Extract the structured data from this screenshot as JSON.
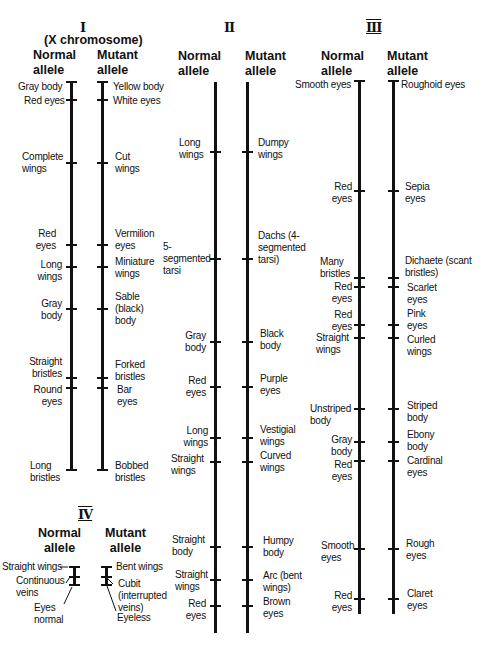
{
  "figure": {
    "type": "genetic-map-of-drosophila-chromosomes",
    "column_headers": {
      "normal": "Normal\nallele",
      "mutant": "Mutant\nallele"
    }
  },
  "chromosomes": [
    {
      "id": "I",
      "numeral": "I",
      "subtitle": "(X chromosome)",
      "normal_header": "Normal",
      "normal_header2": "allele",
      "mutant_header": "Mutant",
      "mutant_header2": "allele",
      "loci": [
        {
          "normal": "Gray body",
          "mutant": "Yellow body"
        },
        {
          "normal": "Red eyes",
          "mutant": "White eyes"
        },
        {
          "normal": "Complete wings",
          "mutant": "Cut wings"
        },
        {
          "normal": "Red eyes",
          "mutant": "Vermilion eyes"
        },
        {
          "normal": "Long wings",
          "mutant": "Miniature wings"
        },
        {
          "normal": "Gray body",
          "mutant": "Sable (black) body"
        },
        {
          "normal": "Straight bristles",
          "mutant": "Forked bristles"
        },
        {
          "normal": "Round eyes",
          "mutant": "Bar eyes"
        },
        {
          "normal": "Long bristles",
          "mutant": "Bobbed bristles"
        }
      ]
    },
    {
      "id": "II",
      "numeral": "II",
      "normal_header": "Normal",
      "normal_header2": "allele",
      "mutant_header": "Mutant",
      "mutant_header2": "allele",
      "loci": [
        {
          "normal": "Long wings",
          "mutant": "Dumpy wings"
        },
        {
          "normal": "5-segmented tarsi",
          "mutant": "Dachs (4-segmented tarsi)"
        },
        {
          "normal": "Gray body",
          "mutant": "Black body"
        },
        {
          "normal": "Red eyes",
          "mutant": "Purple eyes"
        },
        {
          "normal": "Long wings",
          "mutant": "Vestigial wings"
        },
        {
          "normal": "Straight wings",
          "mutant": "Curved wings"
        },
        {
          "normal": "Straight body",
          "mutant": "Humpy body"
        },
        {
          "normal": "Straight wings",
          "mutant": "Arc (bent wings)"
        },
        {
          "normal": "Red eyes",
          "mutant": "Brown eyes"
        }
      ]
    },
    {
      "id": "III",
      "numeral": "III",
      "normal_header": "Normal",
      "normal_header2": "allele",
      "mutant_header": "Mutant",
      "mutant_header2": "allele",
      "loci": [
        {
          "normal": "Smooth eyes",
          "mutant": "Roughoid eyes"
        },
        {
          "normal": "Red eyes",
          "mutant": "Sepia eyes"
        },
        {
          "normal": "Many bristles",
          "mutant": "Dichaete (scant bristles)"
        },
        {
          "normal": "Red eyes",
          "mutant": "Scarlet eyes"
        },
        {
          "normal": "Red eyes",
          "mutant": "Pink eyes"
        },
        {
          "normal": "Straight wings",
          "mutant": "Curled wings"
        },
        {
          "normal": "Unstriped body",
          "mutant": "Striped body"
        },
        {
          "normal": "Gray body",
          "mutant": "Ebony body"
        },
        {
          "normal": "Red eyes",
          "mutant": "Cardinal eyes"
        },
        {
          "normal": "Smooth eyes",
          "mutant": "Rough eyes"
        },
        {
          "normal": "Red eyes",
          "mutant": "Claret eyes"
        }
      ]
    },
    {
      "id": "IV",
      "numeral": "IV",
      "normal_header": "Normal",
      "normal_header2": "allele",
      "mutant_header": "Mutant",
      "mutant_header2": "allele",
      "loci": [
        {
          "normal": "Straight wings",
          "mutant": "Bent wings"
        },
        {
          "normal": "Continuous veins",
          "mutant": "Cubit (interrupted veins)"
        },
        {
          "normal": "Eyes normal",
          "mutant": "Eyeless"
        }
      ]
    }
  ]
}
